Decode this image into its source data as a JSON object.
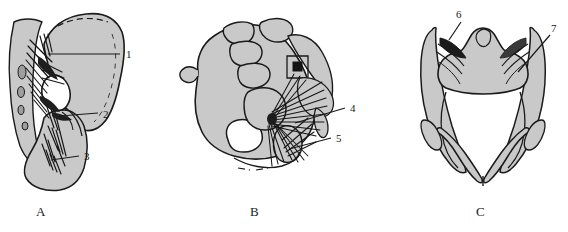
{
  "figure": {
    "type": "anatomical-line-drawing",
    "background_color": "#ffffff",
    "bone_fill_color": "#c9c9c9",
    "outline_color": "#1a1a1a",
    "shading_dark_color": "#2b2b2b",
    "cavity_fill_color": "#ffffff",
    "width": 568,
    "height": 232
  },
  "panels": [
    {
      "id": "A",
      "caption": "A",
      "view": "lateral-view-hemipelvis-with-sacrum",
      "labels": [
        "1",
        "2",
        "3"
      ]
    },
    {
      "id": "B",
      "caption": "B",
      "view": "oblique-view-hemipelvis-with-lumbosacral-spine",
      "labels": [
        "4",
        "5"
      ]
    },
    {
      "id": "C",
      "caption": "C",
      "view": "superior-view-pelvic-inlet",
      "labels": [
        "6",
        "7"
      ]
    }
  ],
  "callouts": [
    {
      "number": "1",
      "panel": "A",
      "text_x": 126,
      "text_y": 58,
      "line": [
        48,
        54,
        120,
        54
      ]
    },
    {
      "number": "2",
      "panel": "A",
      "text_x": 103,
      "text_y": 119,
      "line": [
        60,
        116,
        98,
        113
      ]
    },
    {
      "number": "3",
      "panel": "A",
      "text_x": 84,
      "text_y": 159,
      "line": [
        51,
        160,
        79,
        156
      ]
    },
    {
      "number": "4",
      "panel": "B",
      "text_x": 350,
      "text_y": 112,
      "line": [
        295,
        123,
        345,
        108
      ]
    },
    {
      "number": "5",
      "panel": "B",
      "text_x": 336,
      "text_y": 142,
      "line": [
        289,
        149,
        331,
        138
      ]
    },
    {
      "number": "6",
      "panel": "C",
      "text_x": 459,
      "text_y": 17,
      "line": [
        449,
        40,
        461,
        22
      ]
    },
    {
      "number": "7",
      "panel": "C",
      "text_x": 553,
      "text_y": 31,
      "line": [
        518,
        72,
        550,
        35
      ]
    }
  ],
  "label_values": {
    "one": "1",
    "two": "2",
    "three": "3",
    "four": "4",
    "five": "5",
    "six": "6",
    "seven": "7"
  },
  "captions": {
    "a": "A",
    "b": "B",
    "c": "C"
  }
}
